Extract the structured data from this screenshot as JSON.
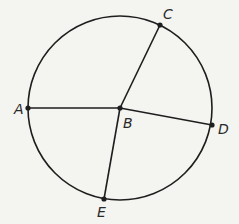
{
  "diagram": {
    "type": "circle-with-radii-and-chord",
    "colors": {
      "background": "#f4f4f1",
      "stroke": "#1e1e1e",
      "label": "#2a2a2a"
    },
    "circle": {
      "cx": 120,
      "cy": 108,
      "r": 92
    },
    "points": {
      "A": {
        "label": "A",
        "x": 28,
        "y": 108,
        "lx": 14,
        "ly": 114
      },
      "B": {
        "label": "B",
        "x": 120,
        "y": 108,
        "lx": 123,
        "ly": 128
      },
      "C": {
        "label": "C",
        "x": 160,
        "y": 25,
        "lx": 163,
        "ly": 19
      },
      "D": {
        "label": "D",
        "x": 212,
        "y": 125,
        "lx": 218,
        "ly": 134
      },
      "E": {
        "label": "E",
        "x": 104,
        "y": 199,
        "lx": 97,
        "ly": 217
      }
    },
    "segments": [
      {
        "name": "segment-AB",
        "from": "A",
        "to": "B"
      },
      {
        "name": "segment-BC",
        "from": "B",
        "to": "C"
      },
      {
        "name": "segment-BD",
        "from": "B",
        "to": "D"
      },
      {
        "name": "segment-BE",
        "from": "B",
        "to": "E"
      }
    ]
  }
}
